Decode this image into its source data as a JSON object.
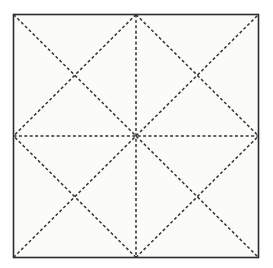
{
  "figure": {
    "canvas": {
      "width": 273,
      "height": 268,
      "background_color": "#ffffff"
    },
    "square": {
      "label": "outer-square",
      "left": 13.5,
      "top": 14.5,
      "right": 258.5,
      "bottom": 257.5,
      "stroke_color": "#2b2b2b",
      "stroke_width": 1.6,
      "fill_color": "#fbfbf9",
      "line_style": "solid"
    },
    "dash_style": {
      "stroke_color": "#333333",
      "stroke_width": 1.5,
      "dash_length": 3,
      "gap_length": 2.4
    },
    "points": {
      "corner_top_left": [
        13.5,
        14.5
      ],
      "corner_top_right": [
        258.5,
        14.5
      ],
      "corner_bottom_left": [
        13.5,
        257.5
      ],
      "corner_bottom_right": [
        258.5,
        257.5
      ],
      "midpoint_top": [
        136,
        14.5
      ],
      "midpoint_bottom": [
        136,
        257.5
      ],
      "midpoint_left": [
        13.5,
        136
      ],
      "midpoint_right": [
        258.5,
        136
      ],
      "center": [
        136,
        136
      ],
      "quadrant_cross_top_left": [
        74.75,
        75.25
      ],
      "quadrant_cross_top_right": [
        197.25,
        75.25
      ],
      "quadrant_cross_bottom_left": [
        74.75,
        196.75
      ],
      "quadrant_cross_bottom_right": [
        197.25,
        196.75
      ]
    },
    "dashed_lines": [
      {
        "name": "diagonal-top-left-to-bottom-right",
        "x1": 13.5,
        "y1": 14.5,
        "x2": 258.5,
        "y2": 257.5
      },
      {
        "name": "diagonal-bottom-left-to-top-right",
        "x1": 13.5,
        "y1": 257.5,
        "x2": 258.5,
        "y2": 14.5
      },
      {
        "name": "center-horizontal-axis",
        "x1": 13.5,
        "y1": 136,
        "x2": 258.5,
        "y2": 136
      },
      {
        "name": "center-vertical-axis",
        "x1": 136,
        "y1": 14.5,
        "x2": 136,
        "y2": 257.5
      },
      {
        "name": "diamond-edge-top-to-left",
        "x1": 136,
        "y1": 14.5,
        "x2": 13.5,
        "y2": 136
      },
      {
        "name": "diamond-edge-top-to-right",
        "x1": 136,
        "y1": 14.5,
        "x2": 258.5,
        "y2": 136
      },
      {
        "name": "diamond-edge-bottom-to-left",
        "x1": 136,
        "y1": 257.5,
        "x2": 13.5,
        "y2": 136
      },
      {
        "name": "diamond-edge-bottom-to-right",
        "x1": 136,
        "y1": 257.5,
        "x2": 258.5,
        "y2": 136
      }
    ]
  }
}
